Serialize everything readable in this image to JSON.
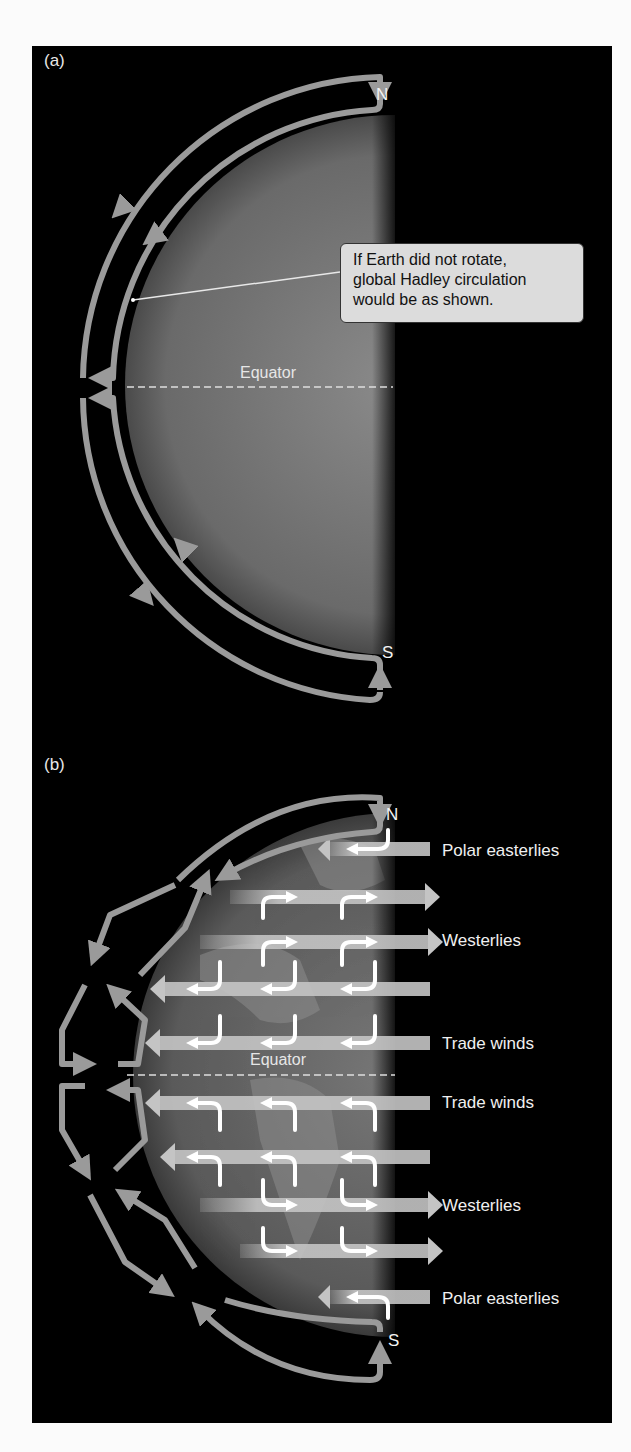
{
  "figure": {
    "panel_a": {
      "label": "(a)",
      "north_label": "N",
      "south_label": "S",
      "equator_label": "Equator",
      "callout": {
        "lines": [
          "If Earth did not rotate,",
          "global Hadley circulation",
          "would be as shown."
        ]
      }
    },
    "panel_b": {
      "label": "(b)",
      "north_label": "N",
      "south_label": "S",
      "equator_label": "Equator",
      "wind_labels": [
        {
          "text": "Polar easterlies",
          "direction": "east-to-west"
        },
        {
          "text": "Westerlies",
          "direction": "west-to-east"
        },
        {
          "text": "Trade winds",
          "direction": "east-to-west"
        },
        {
          "text": "Trade winds",
          "direction": "east-to-west"
        },
        {
          "text": "Westerlies",
          "direction": "west-to-east"
        },
        {
          "text": "Polar easterlies",
          "direction": "east-to-west"
        }
      ]
    },
    "colors": {
      "background": "#000000",
      "arrow": "#9a9a9a",
      "surface_arrow": "#bdbdbd",
      "deflection_arrow": "#ffffff",
      "callout_fill": "#dcdcdc",
      "page": "#fbfbfb"
    }
  }
}
